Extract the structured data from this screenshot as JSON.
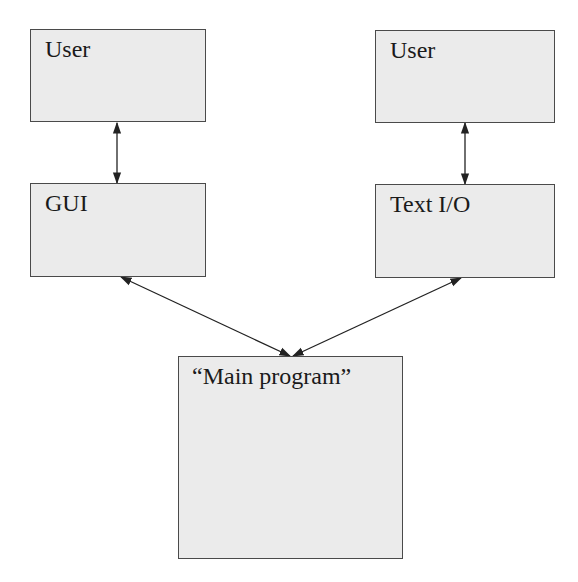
{
  "diagram": {
    "nodes": [
      {
        "id": "user_left",
        "label": "User"
      },
      {
        "id": "user_right",
        "label": "User"
      },
      {
        "id": "gui",
        "label": "GUI"
      },
      {
        "id": "text_io",
        "label": "Text I/O"
      },
      {
        "id": "main_program",
        "label": "“Main program”"
      }
    ],
    "edges": [
      {
        "from": "user_left",
        "to": "gui",
        "direction": "both"
      },
      {
        "from": "user_right",
        "to": "text_io",
        "direction": "both"
      },
      {
        "from": "gui",
        "to": "main_program",
        "direction": "both"
      },
      {
        "from": "text_io",
        "to": "main_program",
        "direction": "both"
      }
    ],
    "colors": {
      "box_fill": "#ebebeb",
      "box_border": "#4a4a4a",
      "arrow": "#222222"
    }
  }
}
